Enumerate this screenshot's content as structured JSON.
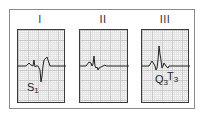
{
  "figure": {
    "panels": [
      {
        "lead": "I",
        "annotations": [
          {
            "main": "S",
            "sub": "1"
          }
        ]
      },
      {
        "lead": "II",
        "annotations": []
      },
      {
        "lead": "III",
        "annotations": [
          {
            "main": "Q",
            "sub": "3"
          },
          {
            "main": "T",
            "sub": "3"
          }
        ]
      }
    ],
    "colors": {
      "trace": "#222222",
      "grid_major": "#c9c9c9",
      "grid_minor": "#e4e4e4",
      "border": "#3a3a3a"
    }
  }
}
